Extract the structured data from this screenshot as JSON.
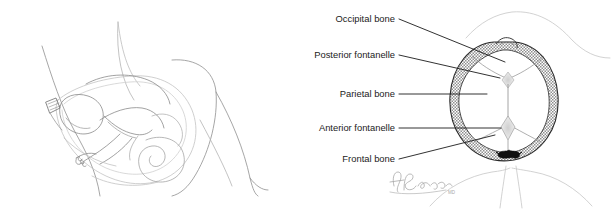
{
  "figure": {
    "background_color": "#ffffff",
    "panels": [
      {
        "id": "left-panel",
        "name": "fetus-in-utero-line-drawing",
        "description": "Line drawing of a fetus in vertex position within the maternal pelvis, mother reclining with flexed knees"
      },
      {
        "id": "right-panel",
        "name": "fetal-skull-vertex-view",
        "description": "Vertex view of the fetal skull crowning at the vaginal introitus, with bones, sutures and fontanelles labeled"
      }
    ]
  },
  "labels": [
    {
      "id": "occipital-bone",
      "text": "Occipital bone",
      "text_anchor": {
        "x": 395,
        "y": 22
      },
      "leader": {
        "x1": 399,
        "y1": 19,
        "x2": 505,
        "y2": 62
      }
    },
    {
      "id": "posterior-fontanelle",
      "text": "Posterior fontanelle",
      "text_anchor": {
        "x": 395,
        "y": 58
      },
      "leader": {
        "x1": 399,
        "y1": 55,
        "x2": 500,
        "y2": 78
      }
    },
    {
      "id": "parietal-bone",
      "text": "Parietal bone",
      "text_anchor": {
        "x": 395,
        "y": 97
      },
      "leader": {
        "x1": 399,
        "y1": 94,
        "x2": 487,
        "y2": 94
      }
    },
    {
      "id": "anterior-fontanelle",
      "text": "Anterior fontanelle",
      "text_anchor": {
        "x": 395,
        "y": 131
      },
      "leader": {
        "x1": 399,
        "y1": 128,
        "x2": 501,
        "y2": 128
      }
    },
    {
      "id": "frontal-bone",
      "text": "Frontal bone",
      "text_anchor": {
        "x": 395,
        "y": 162
      },
      "leader": {
        "x1": 399,
        "y1": 159,
        "x2": 495,
        "y2": 135
      }
    }
  ],
  "signature": {
    "artist_initials": "AB",
    "credential": "MD",
    "position": {
      "x": 392,
      "y": 172
    }
  },
  "colors": {
    "line_dark": "#1b1b1b",
    "line_light": "#9a9a9a",
    "line_faint": "#bfbfbf",
    "bone_fill": "#ffffff",
    "bone_hatch": "#8f8f8f",
    "fontanelle_fill": "#d9d9d9",
    "marker_black": "#111111",
    "background": "#ffffff"
  }
}
